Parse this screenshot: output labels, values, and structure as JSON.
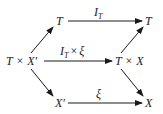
{
  "diagram": {
    "type": "commutative-diagram",
    "nodes": {
      "top_left": "T",
      "top_right": "T",
      "middle_left_main": "T",
      "middle_left_op": "×",
      "middle_left_var": "X′",
      "middle_right_main": "T",
      "middle_right_op": "×",
      "middle_right_var": "X",
      "bottom_left": "X′",
      "bottom_right": "X"
    },
    "edges": {
      "top": {
        "label_main": "I",
        "label_sub": "T"
      },
      "middle": {
        "label_main": "I",
        "label_sub": "T",
        "label_op": "×",
        "label_var": "ξ"
      },
      "bottom": {
        "label_main": "ξ"
      }
    },
    "colors": {
      "ink": "#1a1a1a",
      "background": "#ffffff"
    }
  }
}
